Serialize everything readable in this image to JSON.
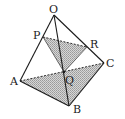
{
  "diagram": {
    "type": "tetrahedron",
    "points": {
      "O": {
        "label": "O",
        "x": 54,
        "y": 15,
        "lx": 49,
        "ly": 13
      },
      "P": {
        "label": "P",
        "x": 43,
        "y": 37,
        "lx": 33,
        "ly": 39
      },
      "R": {
        "label": "R",
        "x": 87,
        "y": 47,
        "lx": 90,
        "ly": 48
      },
      "C": {
        "label": "C",
        "x": 104,
        "y": 63,
        "lx": 106,
        "ly": 67
      },
      "A": {
        "label": "A",
        "x": 20,
        "y": 81,
        "lx": 10,
        "ly": 85
      },
      "Q": {
        "label": "Q",
        "x": 64,
        "y": 72,
        "lx": 65,
        "ly": 84
      },
      "B": {
        "label": "B",
        "x": 69,
        "y": 106,
        "lx": 73,
        "ly": 113
      }
    },
    "shaded_regions": [
      "triangle PQR",
      "triangle ABC"
    ],
    "dashed_edges": [
      "AC",
      "PR"
    ],
    "colors": {
      "stroke": "#1a1a1a",
      "shade": "#bdbdbd"
    }
  }
}
